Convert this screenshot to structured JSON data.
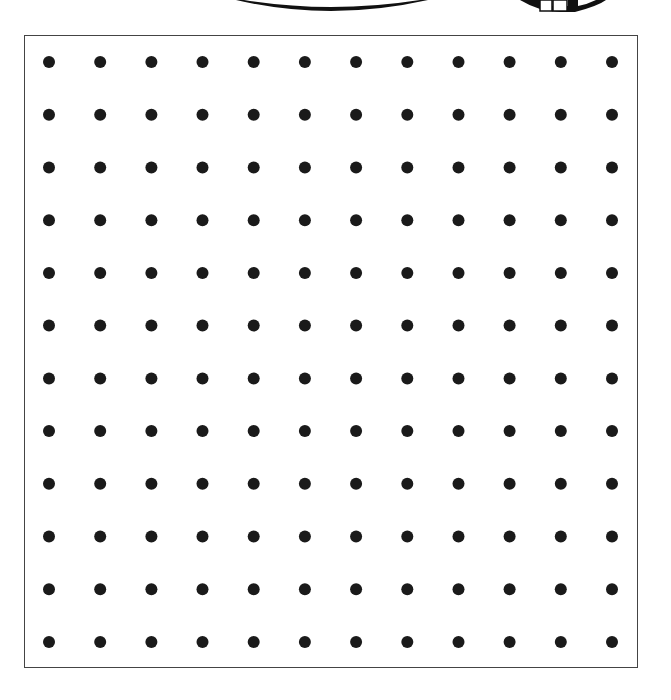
{
  "worksheet": {
    "type": "dot-grid",
    "rows": 12,
    "columns": 12,
    "dot_color": "#1a1a1a",
    "border_color": "#444444",
    "dot_radius": 6,
    "grid": {
      "x_start": 49,
      "x_end": 612,
      "y_start": 62,
      "y_end": 642
    },
    "clipart": {
      "arc": "clipped-oval-bottom",
      "eraser": "clipped-pencil-eraser"
    }
  }
}
